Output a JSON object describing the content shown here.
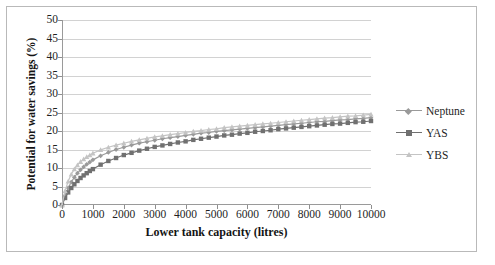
{
  "chart_data": {
    "type": "line",
    "title": "",
    "xlabel": "Lower tank capacity (litres)",
    "ylabel": "Potential for water savings (%)",
    "xlim": [
      0,
      10000
    ],
    "ylim": [
      0,
      50
    ],
    "xticks": [
      0,
      1000,
      2000,
      3000,
      4000,
      5000,
      6000,
      7000,
      8000,
      9000,
      10000
    ],
    "yticks": [
      0,
      5,
      10,
      15,
      20,
      25,
      30,
      35,
      40,
      45,
      50
    ],
    "grid": "horizontal",
    "legend_position": "right",
    "x": [
      0,
      100,
      200,
      300,
      400,
      500,
      600,
      700,
      800,
      900,
      1000,
      1250,
      1500,
      1750,
      2000,
      2250,
      2500,
      2750,
      3000,
      3250,
      3500,
      3750,
      4000,
      4250,
      4500,
      4750,
      5000,
      5250,
      5500,
      5750,
      6000,
      6250,
      6500,
      6750,
      7000,
      7250,
      7500,
      7750,
      8000,
      8250,
      8500,
      8750,
      9000,
      9250,
      9500,
      9750,
      10000
    ],
    "series": [
      {
        "name": "Neptune",
        "color": "#9a9a9a",
        "marker": "diamond",
        "values": [
          0.0,
          2.6,
          4.6,
          6.2,
          7.5,
          8.6,
          9.5,
          10.3,
          11.0,
          11.6,
          12.2,
          13.3,
          14.2,
          15.0,
          15.6,
          16.2,
          16.7,
          17.1,
          17.5,
          17.9,
          18.2,
          18.5,
          18.8,
          19.1,
          19.4,
          19.6,
          19.9,
          20.1,
          20.3,
          20.5,
          20.7,
          20.9,
          21.1,
          21.3,
          21.5,
          21.7,
          21.9,
          22.1,
          22.3,
          22.5,
          22.6,
          22.8,
          23.0,
          23.1,
          23.3,
          23.4,
          23.6
        ]
      },
      {
        "name": "YAS",
        "color": "#707070",
        "marker": "square",
        "values": [
          0.0,
          1.9,
          3.4,
          4.6,
          5.6,
          6.5,
          7.3,
          8.0,
          8.6,
          9.2,
          9.7,
          10.9,
          11.9,
          12.7,
          13.5,
          14.1,
          14.7,
          15.2,
          15.7,
          16.1,
          16.5,
          16.9,
          17.2,
          17.6,
          17.9,
          18.2,
          18.5,
          18.8,
          19.0,
          19.3,
          19.5,
          19.8,
          20.0,
          20.2,
          20.5,
          20.7,
          20.9,
          21.1,
          21.3,
          21.5,
          21.7,
          21.9,
          22.0,
          22.2,
          22.4,
          22.5,
          22.7
        ]
      },
      {
        "name": "YBS",
        "color": "#c4c4c4",
        "marker": "triangle",
        "values": [
          0.0,
          3.8,
          6.4,
          8.3,
          9.7,
          10.8,
          11.7,
          12.4,
          13.0,
          13.5,
          14.0,
          14.9,
          15.6,
          16.2,
          16.7,
          17.2,
          17.6,
          18.0,
          18.4,
          18.7,
          19.0,
          19.3,
          19.6,
          19.9,
          20.1,
          20.4,
          20.6,
          20.9,
          21.1,
          21.3,
          21.5,
          21.7,
          21.9,
          22.1,
          22.3,
          22.5,
          22.7,
          22.9,
          23.1,
          23.3,
          23.5,
          23.6,
          23.8,
          24.0,
          24.1,
          24.3,
          24.5
        ]
      }
    ]
  },
  "legend": {
    "items": [
      {
        "label": "Neptune"
      },
      {
        "label": "YAS"
      },
      {
        "label": "YBS"
      }
    ]
  }
}
